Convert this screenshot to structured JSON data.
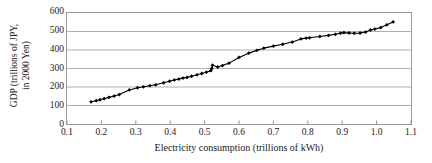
{
  "chart_data": {
    "type": "scatter",
    "title": "",
    "subtitle": "",
    "xlabel": "Electricity consumption (trillions of kWh)",
    "ylabel": "GDP (trillions of JPY, in 2000 Yen)",
    "ylabel_line1": "GDP (trillions of JPY,",
    "ylabel_line2": "in 2000 Yen)",
    "xlim": [
      0.1,
      1.1
    ],
    "ylim": [
      0,
      600
    ],
    "xticks": [
      "0.1",
      "0.2",
      "0.3",
      "0.4",
      "0.5",
      "0.6",
      "0.7",
      "0.8",
      "0.9",
      "1.0",
      "1.1"
    ],
    "xtick_values": [
      0.1,
      0.2,
      0.3,
      0.4,
      0.5,
      0.6,
      0.7,
      0.8,
      0.9,
      1.0,
      1.1
    ],
    "yticks": [
      "0",
      "100",
      "200",
      "300",
      "400",
      "500",
      "600"
    ],
    "ytick_values": [
      0,
      100,
      200,
      300,
      400,
      500,
      600
    ],
    "grid": "horizontal",
    "legend": "none",
    "marker": "filled-diamond",
    "line_connected": true,
    "series": [
      {
        "name": "GDP vs electricity consumption",
        "color": "#000000",
        "x": [
          0.17,
          0.185,
          0.196,
          0.208,
          0.222,
          0.237,
          0.252,
          0.281,
          0.305,
          0.322,
          0.341,
          0.358,
          0.381,
          0.398,
          0.412,
          0.425,
          0.437,
          0.449,
          0.462,
          0.478,
          0.492,
          0.505,
          0.518,
          0.521,
          0.523,
          0.538,
          0.552,
          0.571,
          0.6,
          0.628,
          0.652,
          0.672,
          0.7,
          0.727,
          0.755,
          0.78,
          0.795,
          0.805,
          0.835,
          0.86,
          0.88,
          0.895,
          0.905,
          0.92,
          0.935,
          0.952,
          0.968,
          0.982,
          0.995,
          1.012,
          1.03,
          1.048
        ],
        "y": [
          120,
          126,
          131,
          137,
          144,
          151,
          159,
          184,
          196,
          201,
          207,
          212,
          223,
          231,
          238,
          243,
          248,
          252,
          258,
          266,
          273,
          280,
          288,
          300,
          318,
          308,
          316,
          329,
          360,
          383,
          398,
          410,
          421,
          431,
          443,
          460,
          464,
          466,
          473,
          479,
          485,
          491,
          494,
          492,
          490,
          492,
          497,
          508,
          513,
          521,
          536,
          552
        ]
      }
    ]
  }
}
